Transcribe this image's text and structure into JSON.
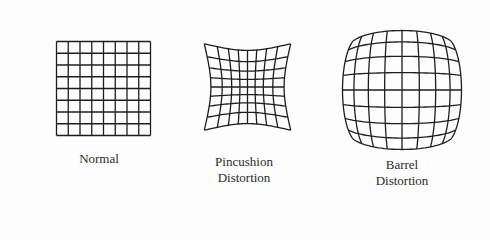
{
  "figure": {
    "panels": [
      {
        "id": "normal",
        "lines": [
          "Normal"
        ],
        "grid_divisions": 8
      },
      {
        "id": "pincushion",
        "lines": [
          "Pincushion",
          "Distortion"
        ],
        "grid_divisions": 8
      },
      {
        "id": "barrel",
        "lines": [
          "Barrel",
          "Distortion"
        ],
        "grid_divisions": 8
      }
    ],
    "colors": {
      "line": "#1e1e1e",
      "background": "#fdfdfd"
    }
  }
}
